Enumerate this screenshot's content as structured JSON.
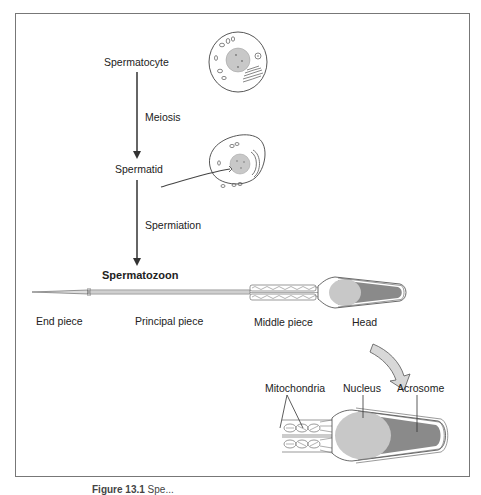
{
  "figure": {
    "stages": {
      "spermatocyte": "Spermatocyte",
      "meiosis": "Meiosis",
      "spermatid": "Spermatid",
      "spermiation": "Spermiation",
      "spermatozoon": "Spermatozoon"
    },
    "parts": {
      "end_piece": "End piece",
      "principal_piece": "Principal piece",
      "middle_piece": "Middle piece",
      "head": "Head"
    },
    "detail": {
      "mitochondria": "Mitochondria",
      "nucleus": "Nucleus",
      "acrosome": "Acrosome"
    },
    "caption": {
      "label": "Figure 13.1",
      "text": "Spe..."
    },
    "colors": {
      "line": "#333333",
      "nucleus": "#c8c8c8",
      "acrosome": "#8a8a8a",
      "arrow_fill": "#d8d8d8",
      "frame": "#777777"
    }
  }
}
